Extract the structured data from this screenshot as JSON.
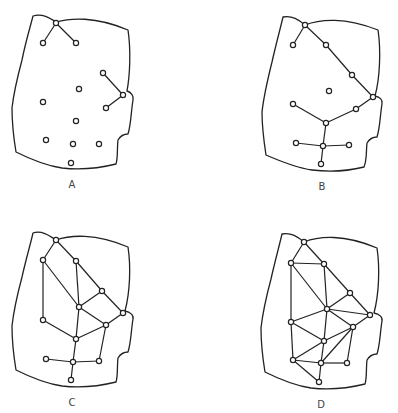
{
  "figure": {
    "panels": [
      {
        "label": "A",
        "label_pos": [
          72,
          188
        ],
        "outline": "M33,16 C42,13 50,18 56,22 C70,18 95,16 128,30 C131,50 130,75 127,91 C131,92 134,96 133,100 C131,112 131,125 128,134 C124,134 121,135 118,140 C117,148 118,158 116,164 C100,168 80,170 62,168 C48,166 32,160 16,152 C14,140 12,120 12,108 C14,90 18,75 22,60 C26,40 30,28 33,16 Z",
        "nodes": [
          [
            56,
            23
          ],
          [
            43,
            43
          ],
          [
            76,
            43
          ],
          [
            103,
            73
          ],
          [
            79,
            89
          ],
          [
            123,
            95
          ],
          [
            43,
            102
          ],
          [
            106,
            108
          ],
          [
            76,
            121
          ],
          [
            46,
            140
          ],
          [
            73,
            144
          ],
          [
            99,
            144
          ],
          [
            71,
            163
          ]
        ],
        "edges": [
          [
            0,
            1
          ],
          [
            0,
            2
          ],
          [
            3,
            5
          ],
          [
            5,
            7
          ]
        ]
      },
      {
        "label": "B",
        "label_pos": [
          322,
          190
        ],
        "outline": "M283,17 C292,15 299,20 305,25 C320,19 345,17 378,30 C381,50 380,78 375,96 C380,97 383,100 382,104 C380,116 380,128 377,137 C373,137 370,138 367,143 C366,152 367,160 364,167 C348,171 328,172 312,170 C298,168 282,162 266,155 C264,142 262,124 262,112 C264,94 268,78 272,62 C276,44 280,30 283,17 Z",
        "nodes": [
          [
            305,
            25
          ],
          [
            293,
            45
          ],
          [
            326,
            45
          ],
          [
            352,
            75
          ],
          [
            329,
            91
          ],
          [
            373,
            97
          ],
          [
            293,
            104
          ],
          [
            356,
            109
          ],
          [
            326,
            123
          ],
          [
            296,
            143
          ],
          [
            323,
            146
          ],
          [
            349,
            145
          ],
          [
            321,
            164
          ]
        ],
        "edges": [
          [
            0,
            1
          ],
          [
            0,
            2
          ],
          [
            2,
            3
          ],
          [
            3,
            5
          ],
          [
            5,
            7
          ],
          [
            7,
            8
          ],
          [
            6,
            8
          ],
          [
            8,
            10
          ],
          [
            9,
            10
          ],
          [
            10,
            11
          ],
          [
            10,
            12
          ]
        ]
      },
      {
        "label": "C",
        "label_pos": [
          72,
          406
        ],
        "outline": "M33,233 C42,230 50,236 56,240 C70,235 95,233 128,247 C131,267 130,292 125,311 C130,312 134,315 133,319 C131,331 131,343 128,352 C124,352 121,353 118,358 C117,366 118,376 116,382 C100,386 80,388 62,386 C48,384 32,378 16,370 C14,358 12,338 12,326 C14,308 18,292 22,277 C26,259 30,246 33,233 Z",
        "nodes": [
          [
            56,
            240
          ],
          [
            43,
            260
          ],
          [
            76,
            261
          ],
          [
            102,
            291
          ],
          [
            79,
            307
          ],
          [
            123,
            313
          ],
          [
            43,
            320
          ],
          [
            106,
            325
          ],
          [
            76,
            339
          ],
          [
            46,
            359
          ],
          [
            73,
            362
          ],
          [
            99,
            361
          ],
          [
            71,
            380
          ]
        ],
        "edges": [
          [
            0,
            1
          ],
          [
            0,
            2
          ],
          [
            1,
            4
          ],
          [
            1,
            6
          ],
          [
            2,
            4
          ],
          [
            2,
            3
          ],
          [
            3,
            5
          ],
          [
            3,
            4
          ],
          [
            4,
            7
          ],
          [
            5,
            7
          ],
          [
            4,
            8
          ],
          [
            6,
            8
          ],
          [
            8,
            7
          ],
          [
            7,
            11
          ],
          [
            8,
            10
          ],
          [
            9,
            10
          ],
          [
            10,
            11
          ],
          [
            10,
            12
          ]
        ]
      },
      {
        "label": "D",
        "label_pos": [
          321,
          408
        ],
        "outline": "M282,234 C291,232 298,237 304,242 C319,236 344,234 377,248 C380,268 379,294 374,313 C379,314 383,317 382,321 C380,333 380,345 377,354 C373,354 370,355 367,360 C366,368 367,378 365,384 C349,388 329,390 311,388 C297,386 281,380 265,372 C263,360 261,340 261,328 C263,310 267,294 271,279 C275,261 279,247 282,234 Z",
        "nodes": [
          [
            304,
            242
          ],
          [
            291,
            263
          ],
          [
            324,
            264
          ],
          [
            350,
            293
          ],
          [
            327,
            309
          ],
          [
            370,
            315
          ],
          [
            291,
            322
          ],
          [
            353,
            327
          ],
          [
            324,
            341
          ],
          [
            293,
            360
          ],
          [
            321,
            363
          ],
          [
            347,
            363
          ],
          [
            319,
            382
          ]
        ],
        "edges": [
          [
            0,
            1
          ],
          [
            0,
            2
          ],
          [
            1,
            2
          ],
          [
            1,
            4
          ],
          [
            2,
            4
          ],
          [
            2,
            3
          ],
          [
            3,
            5
          ],
          [
            3,
            4
          ],
          [
            4,
            5
          ],
          [
            1,
            6
          ],
          [
            6,
            4
          ],
          [
            6,
            8
          ],
          [
            4,
            8
          ],
          [
            4,
            7
          ],
          [
            5,
            7
          ],
          [
            7,
            8
          ],
          [
            7,
            10
          ],
          [
            7,
            11
          ],
          [
            6,
            9
          ],
          [
            9,
            8
          ],
          [
            9,
            10
          ],
          [
            9,
            12
          ],
          [
            8,
            10
          ],
          [
            10,
            11
          ],
          [
            10,
            12
          ]
        ]
      }
    ]
  },
  "colors": {
    "stroke": "#222222",
    "background": "#ffffff",
    "label": "#444444"
  }
}
